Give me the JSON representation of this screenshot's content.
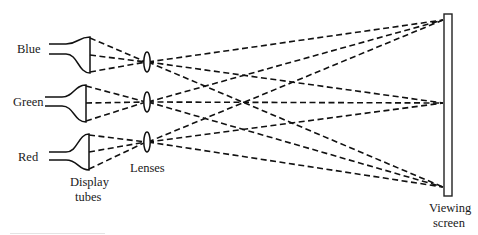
{
  "diagram": {
    "labels": {
      "blue": "Blue",
      "green": "Green",
      "red": "Red",
      "display_tubes_line1": "Display",
      "display_tubes_line2": "tubes",
      "lenses": "Lenses",
      "viewing_screen_line1": "Viewing",
      "viewing_screen_line2": "screen"
    },
    "components": {
      "tubes": [
        "Blue",
        "Green",
        "Red"
      ],
      "lenses_count": 3,
      "screen_targets": [
        "top",
        "middle",
        "bottom"
      ]
    },
    "colors": {
      "line": "#111111",
      "background": "#ffffff"
    }
  }
}
